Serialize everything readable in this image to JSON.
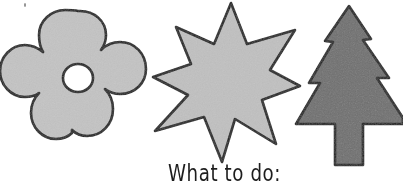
{
  "page": {
    "background_color": "#ffffff",
    "width": 403,
    "height": 184
  },
  "caption": {
    "text": "What to do:",
    "color": "#1d1d1d"
  },
  "palette": {
    "outline": "#1a1a1a",
    "light_gray_fill": "#c3c3c3",
    "star_fill": "#c0c0c0",
    "dark_gray_fill": "#6f6f6f",
    "hole_fill": "#ffffff",
    "speck": "#8d8d8d"
  },
  "shapes": [
    {
      "name": "flower",
      "label": "Flower template",
      "petals": 5,
      "fill": "#c3c3c3",
      "outline": "#1a1a1a",
      "has_center_hole": true,
      "hole_fill": "#ffffff",
      "center": [
        78,
        78
      ],
      "hole_radius": 13
    },
    {
      "name": "star",
      "label": "Six-pointed star template",
      "points": 6,
      "fill": "#c0c0c0",
      "outline": "#1a1a1a",
      "center": [
        228,
        80
      ]
    },
    {
      "name": "tree",
      "label": "Fir tree template",
      "tiers": 3,
      "fill": "#6f6f6f",
      "outline": "#1a1a1a",
      "center": [
        348,
        85
      ]
    }
  ],
  "marks": {
    "corner_speck": {
      "label": "scan speck",
      "x": 24,
      "y": 4
    }
  }
}
